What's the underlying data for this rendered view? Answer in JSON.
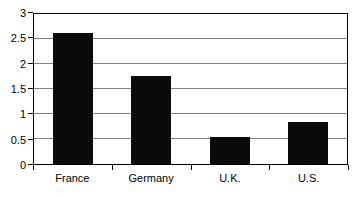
{
  "chart_data": {
    "type": "bar",
    "title": "",
    "xlabel": "",
    "ylabel": "",
    "categories": [
      "France",
      "Germany",
      "U.K.",
      "U.S."
    ],
    "values": [
      2.62,
      1.77,
      0.55,
      0.85
    ],
    "series": [
      {
        "name": "",
        "values": [
          2.62,
          1.77,
          0.55,
          0.85
        ]
      }
    ],
    "ylim": [
      0,
      3
    ],
    "y_ticks": [
      0,
      0.5,
      1,
      1.5,
      2,
      2.5,
      3
    ],
    "y_tick_labels": [
      "0",
      "0.5",
      "1",
      "1.5",
      "2",
      "2.5",
      "3"
    ],
    "grid": true,
    "grid_axis": "y",
    "legend": false,
    "legend_position": "none",
    "colors": {
      "bar": "#0a0a0a",
      "gridline": "#808080",
      "axis": "#000000",
      "text": "#000000",
      "background": "#ffffff"
    }
  }
}
